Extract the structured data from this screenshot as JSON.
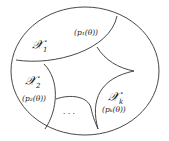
{
  "diagram": {
    "regions": [
      {
        "id": "x1",
        "label": "𝒳",
        "subscript": "1",
        "param": "(p₁(θ))"
      },
      {
        "id": "x2",
        "label": "𝒳",
        "subscript": "2",
        "param": "(p₂(θ))"
      },
      {
        "id": "xk",
        "label": "𝒳",
        "subscript": "k",
        "param": "(pₖ(θ))"
      },
      {
        "id": "dots",
        "label": "· · ·"
      }
    ],
    "colors": {
      "stroke": "#333333",
      "background": "#ffffff"
    }
  }
}
